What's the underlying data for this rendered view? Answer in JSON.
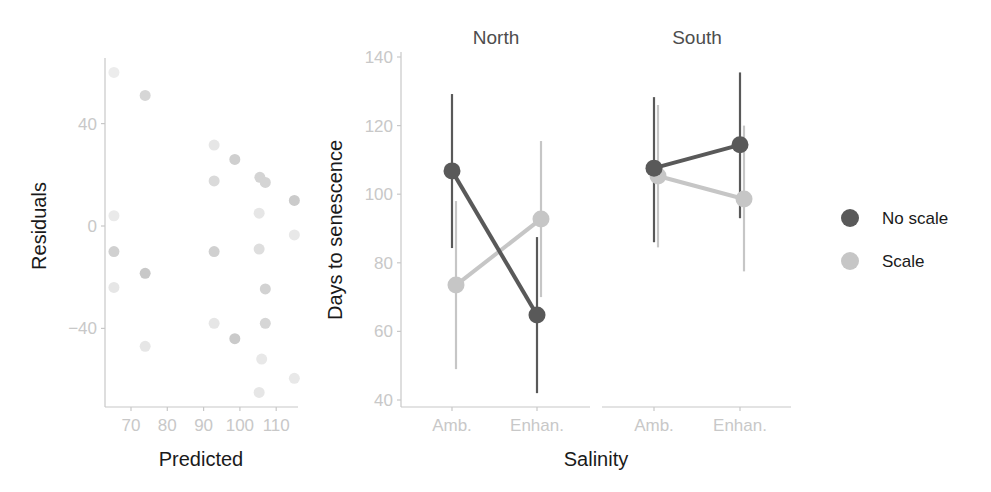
{
  "chart_data": [
    {
      "type": "scatter",
      "title": "",
      "xlabel": "Predicted",
      "ylabel": "Residuals",
      "xlim": [
        63,
        118
      ],
      "ylim": [
        -70,
        66
      ],
      "xticks": [
        70,
        80,
        90,
        100,
        110
      ],
      "xtick_labels": [
        "70",
        "80",
        "90",
        "100",
        "110"
      ],
      "yticks": [
        -40,
        0,
        40
      ],
      "ytick_labels": [
        "-40",
        "0",
        "40"
      ],
      "grid": false,
      "points": [
        {
          "x": 65.3,
          "y": 60,
          "shade": "#ececec"
        },
        {
          "x": 73.9,
          "y": 51,
          "shade": "#d6d6d6"
        },
        {
          "x": 92.9,
          "y": 31.6,
          "shade": "#e6e6e6"
        },
        {
          "x": 98.6,
          "y": 26,
          "shade": "#cfcfcf"
        },
        {
          "x": 92.9,
          "y": 17.6,
          "shade": "#dadada"
        },
        {
          "x": 105.5,
          "y": 19,
          "shade": "#d4d4d4"
        },
        {
          "x": 107,
          "y": 17,
          "shade": "#d4d4d4"
        },
        {
          "x": 115,
          "y": 10,
          "shade": "#cbcbcb"
        },
        {
          "x": 65.3,
          "y": 4,
          "shade": "#eaeaea"
        },
        {
          "x": 105.3,
          "y": 5,
          "shade": "#e6e6e6"
        },
        {
          "x": 115,
          "y": -3.5,
          "shade": "#e8e8e8"
        },
        {
          "x": 65.3,
          "y": -10,
          "shade": "#d0d0d0"
        },
        {
          "x": 92.9,
          "y": -10,
          "shade": "#d0d0d0"
        },
        {
          "x": 105.3,
          "y": -9,
          "shade": "#dedede"
        },
        {
          "x": 73.9,
          "y": -18.5,
          "shade": "#c8c8c8"
        },
        {
          "x": 65.3,
          "y": -24,
          "shade": "#e6e6e6"
        },
        {
          "x": 107,
          "y": -24.6,
          "shade": "#d2d2d2"
        },
        {
          "x": 92.9,
          "y": -38,
          "shade": "#e6e6e6"
        },
        {
          "x": 107,
          "y": -38,
          "shade": "#d6d6d6"
        },
        {
          "x": 98.6,
          "y": -44,
          "shade": "#cacaca"
        },
        {
          "x": 73.9,
          "y": -47,
          "shade": "#e6e6e6"
        },
        {
          "x": 106,
          "y": -52,
          "shade": "#e8e8e8"
        },
        {
          "x": 115,
          "y": -59.5,
          "shade": "#e8e8e8"
        },
        {
          "x": 105.3,
          "y": -65,
          "shade": "#e6e6e6"
        }
      ]
    },
    {
      "type": "line",
      "subtype": "interaction plot with error bars, faceted",
      "xlabel": "Salinity",
      "ylabel": "Days to senescence",
      "ylim": [
        38,
        142
      ],
      "yticks": [
        40,
        60,
        80,
        100,
        120,
        140
      ],
      "ytick_labels": [
        "40",
        "60",
        "80",
        "100",
        "120",
        "140"
      ],
      "categories": [
        "Amb.",
        "Enhan."
      ],
      "grid": false,
      "legend_position": "right",
      "legend": [
        {
          "name": "No scale",
          "color": "#595959"
        },
        {
          "name": "Scale",
          "color": "#c6c6c6"
        }
      ],
      "facets": [
        {
          "title": "North",
          "series": [
            {
              "name": "No scale",
              "values": [
                106.8,
                64.8
              ],
              "lower": [
                84.3,
                42
              ],
              "upper": [
                129.2,
                87.5
              ]
            },
            {
              "name": "Scale",
              "values": [
                73.5,
                92.8
              ],
              "lower": [
                49,
                70
              ],
              "upper": [
                98,
                115.5
              ]
            }
          ]
        },
        {
          "title": "South",
          "series": [
            {
              "name": "No scale",
              "values": [
                107.6,
                114.4
              ],
              "lower": [
                86,
                93
              ],
              "upper": [
                128.3,
                135.5
              ]
            },
            {
              "name": "Scale",
              "values": [
                105.3,
                98.6
              ],
              "lower": [
                84.5,
                77.5
              ],
              "upper": [
                126,
                120
              ]
            }
          ]
        }
      ]
    }
  ],
  "labels": {
    "left_ylabel": "Residuals",
    "left_xlabel": "Predicted",
    "right_ylabel": "Days to senescence",
    "right_xlabel": "Salinity",
    "facet_north": "North",
    "facet_south": "South",
    "legend_no_scale": "No scale",
    "legend_scale": "Scale"
  }
}
